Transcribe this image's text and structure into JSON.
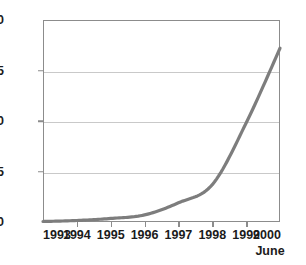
{
  "chart_data": {
    "type": "line",
    "title": "",
    "subtitle": "",
    "xlabel": "",
    "ylabel": "",
    "x": [
      "1993",
      "1994",
      "1995",
      "1996",
      "1997",
      "1998",
      "1999",
      "2000"
    ],
    "x_annotation": "June",
    "x_annotation_at": "2000",
    "categories": [
      "1993",
      "1994",
      "1995",
      "1996",
      "1997",
      "1998",
      "1999",
      "2000"
    ],
    "values": [
      0.05,
      0.15,
      0.35,
      0.7,
      1.9,
      3.7,
      9.8,
      17.2
    ],
    "series": [
      {
        "name": "",
        "values": [
          0.05,
          0.15,
          0.35,
          0.7,
          1.9,
          3.7,
          9.8,
          17.2
        ]
      }
    ],
    "ylim": [
      0,
      20
    ],
    "yticks": [
      0,
      5,
      10,
      15,
      20
    ],
    "ytick_labels": [
      "0",
      "5",
      "10",
      "15",
      "20"
    ],
    "xtick_labels": [
      "1993",
      "1994",
      "1995",
      "1996",
      "1997",
      "1998",
      "1999",
      "2000"
    ],
    "grid": "horizontal",
    "legend": "none",
    "line_color": "#7d7d7d",
    "grid_color": "#c9c9c9",
    "axis_color": "#8c8c8c",
    "text_color": "#1b1b1b",
    "background": "#ffffff"
  }
}
